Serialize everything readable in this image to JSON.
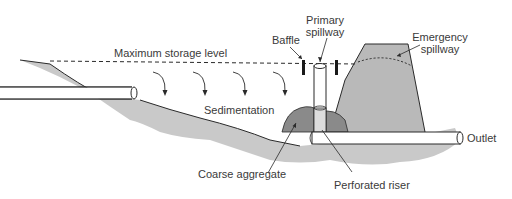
{
  "diagram": {
    "type": "sediment basin cross-section",
    "labels": {
      "max_storage_level": "Maximum storage level",
      "baffle": "Baffle",
      "primary_spillway_line1": "Primary",
      "primary_spillway_line2": "spillway",
      "emergency_spillway_line1": "Emergency",
      "emergency_spillway_line2": "spillway",
      "sedimentation": "Sedimentation",
      "outlet": "Outlet",
      "coarse_aggregate": "Coarse aggregate",
      "perforated_riser": "Perforated riser"
    },
    "colors": {
      "ground": "#c9c9c9",
      "embankment": "#b9b9b9",
      "aggregate": "#8a8a8a",
      "riser_lower": "#dcdcdc",
      "pipe": "#ffffff",
      "outline": "#2a2a2a",
      "text": "#3a3a3a"
    }
  }
}
